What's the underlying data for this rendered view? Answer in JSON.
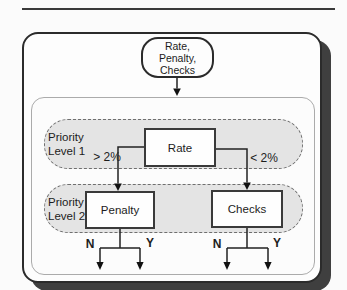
{
  "page": {
    "background": "#fbfbfb",
    "colors": {
      "region_fill": "#e4e4e4",
      "region_border": "#6f6f6f",
      "card_shadow": "#3f3f3f",
      "line": "#222222"
    }
  },
  "flowchart": {
    "start_node": {
      "line1": "Rate,",
      "line2": "Penalty,",
      "line3": "Checks"
    },
    "level1": {
      "label_line1": "Priority",
      "label_line2": "Level 1",
      "node": "Rate",
      "left_condition": "> 2%",
      "right_condition": "< 2%"
    },
    "level2": {
      "label_line1": "Priority",
      "label_line2": "Level 2",
      "left_node": "Penalty",
      "right_node": "Checks"
    },
    "outcomes": {
      "no": "N",
      "yes": "Y"
    }
  }
}
